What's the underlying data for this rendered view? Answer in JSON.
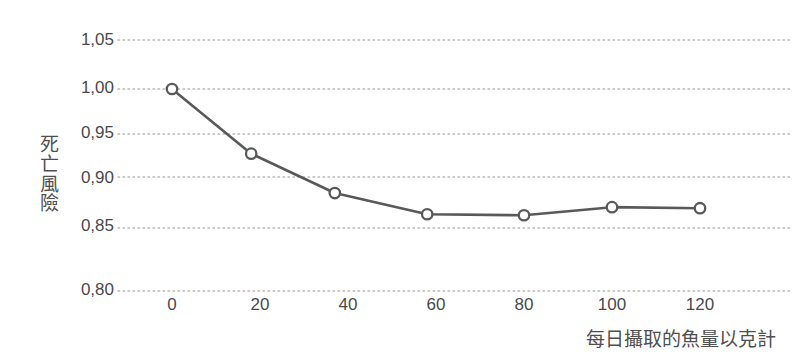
{
  "chart_data": {
    "type": "line",
    "title": "",
    "subtitle": "",
    "xlabel": "每日攝取的魚量以克計",
    "ylabel": "死亡風險",
    "ylabel_chars": [
      "死",
      "亡",
      "風",
      "險"
    ],
    "x": [
      0,
      18,
      37,
      58,
      80,
      100,
      120
    ],
    "values": [
      1.0,
      0.936,
      0.897,
      0.876,
      0.875,
      0.883,
      0.882
    ],
    "series": [
      {
        "name": "死亡風險",
        "values": [
          1.0,
          0.936,
          0.897,
          0.876,
          0.875,
          0.883,
          0.882
        ]
      }
    ],
    "xlim": [
      -4,
      133
    ],
    "ylim": [
      0.8,
      1.05
    ],
    "xticks": [
      0,
      20,
      40,
      60,
      80,
      100,
      120
    ],
    "xtick_labels": [
      "0",
      "20",
      "40",
      "60",
      "80",
      "100",
      "120"
    ],
    "yticks": [
      0.8,
      0.85,
      0.9,
      0.95,
      1.0,
      1.05
    ],
    "ytick_labels": [
      "0,80",
      "0,85",
      "0,90",
      "0,95",
      "1,00",
      "1,05"
    ],
    "grid": {
      "horizontal": true,
      "vertical": false,
      "style": "dotted",
      "color": "#b9b9b9"
    },
    "legend": {
      "visible": false,
      "position": "none"
    },
    "marker": {
      "shape": "circle-open",
      "fill": "#ffffff",
      "stroke": "#58595b",
      "radius": 5.2
    },
    "line": {
      "color": "#58595b",
      "width": 2.6
    },
    "background": "#ffffff",
    "axis_spines": false,
    "annotations": []
  }
}
